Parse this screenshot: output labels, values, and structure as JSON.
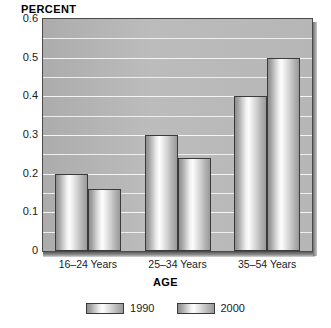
{
  "chart_data": {
    "type": "bar",
    "title": "",
    "ylabel": "PERCENT",
    "xlabel": "AGE",
    "categories": [
      "16–24 Years",
      "25–34 Years",
      "35–54 Years"
    ],
    "series": [
      {
        "name": "1990",
        "values": [
          0.2,
          0.3,
          0.4
        ]
      },
      {
        "name": "2000",
        "values": [
          0.16,
          0.24,
          0.5
        ]
      }
    ],
    "ylim": [
      0,
      0.6
    ],
    "yticks": [
      "0",
      "0.1",
      "0.2",
      "0.3",
      "0.4",
      "0.5",
      "0.6"
    ],
    "ytick_values": [
      0,
      0.1,
      0.2,
      0.3,
      0.4,
      0.5,
      0.6
    ],
    "minor_gridline_step": 0.05,
    "grid": true,
    "legend_position": "bottom",
    "colors": {
      "plot_background": "#b4b4b4",
      "gridline": "#eeeeee",
      "bar_outline": "#3a3a3a",
      "bar_highlight": "#fdfdfd",
      "bar_shadow": "#8f8f8f",
      "axis_text": "#1a1a1a",
      "page_background": "#ffffff"
    }
  },
  "legend": {
    "items": [
      {
        "label": "1990"
      },
      {
        "label": "2000"
      }
    ]
  }
}
